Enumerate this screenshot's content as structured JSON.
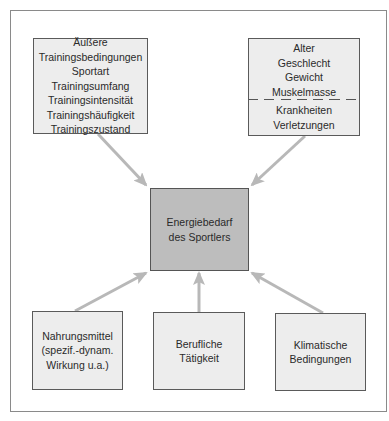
{
  "diagram": {
    "type": "influence-diagram",
    "center": {
      "lines": [
        "Energiebedarf",
        "des Sportlers"
      ],
      "fill": "#bdbdbd"
    },
    "top_left": {
      "lines": [
        "Äußere",
        "Trainingsbedingungen",
        "Sportart",
        "Trainingsumfang",
        "Trainingsintensität",
        "Trainingshäufigkeit",
        "Trainingszustand"
      ]
    },
    "top_right": {
      "upper_lines": [
        "Alter",
        "Geschlecht",
        "Gewicht",
        "Muskelmasse"
      ],
      "lower_lines": [
        "Krankheiten",
        "Verletzungen"
      ]
    },
    "bottom_left": {
      "lines": [
        "Nahrungsmittel",
        "(spezif.-dynam.",
        "Wirkung u.a.)"
      ]
    },
    "bottom_middle": {
      "lines": [
        "Berufliche",
        "Tätigkeit"
      ]
    },
    "bottom_right": {
      "lines": [
        "Klimatische",
        "Bedingungen"
      ]
    },
    "colors": {
      "box_fill": "#ededed",
      "center_fill": "#bdbdbd",
      "border": "#5a5a5a",
      "arrow": "#b8b8b8",
      "frame": "#8a8a8a"
    }
  }
}
